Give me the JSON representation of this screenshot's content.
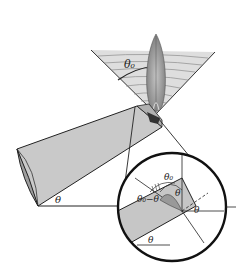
{
  "figure": {
    "labels": {
      "cone_angle": "θ₀",
      "bar_tilt": "θ",
      "inset_diff": "θ₀−θ",
      "inset_cone": "θ₀",
      "inset_theta_top": "θ",
      "inset_theta_right": "θ",
      "inset_theta_bottom": "θ"
    },
    "colors": {
      "bar_fill": "#c8c8c8",
      "bar_cap": "#a8a8a8",
      "cone_fill": "#dcdcdc",
      "lobe": "#8a8a8a",
      "line": "#222222"
    }
  }
}
